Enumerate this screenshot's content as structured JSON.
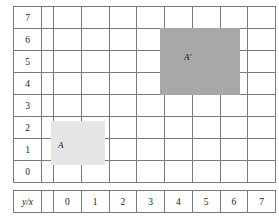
{
  "figure": {
    "kind": "coordinate-grid",
    "axis_corner_label": "y/x",
    "y_labels": [
      "7",
      "6",
      "5",
      "4",
      "3",
      "2",
      "1",
      "0"
    ],
    "x_labels": [
      "0",
      "1",
      "2",
      "3",
      "4",
      "5",
      "6",
      "7"
    ],
    "colors": {
      "grid_line": "#7a7a7a",
      "region_a_fill": "#e6e6e6",
      "region_a_prime_fill": "#a8a8a8",
      "text": "#1a1a1a"
    },
    "regions": [
      {
        "label": "A",
        "fill": "#e6e6e6",
        "x_range": [
          0,
          1
        ],
        "y_range": [
          1,
          2
        ]
      },
      {
        "label": "A′",
        "fill": "#a8a8a8",
        "x_range": [
          4,
          6
        ],
        "y_range": [
          4,
          6
        ]
      }
    ]
  }
}
